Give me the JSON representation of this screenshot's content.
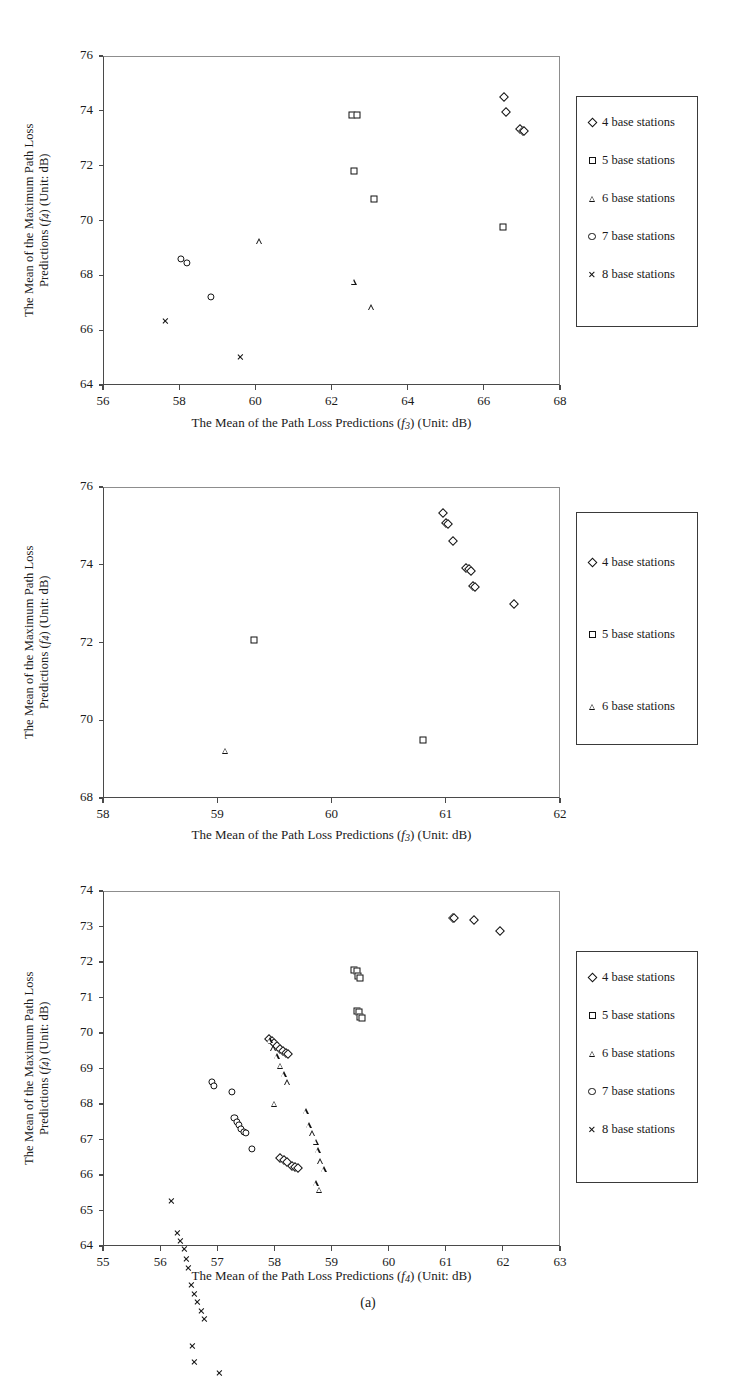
{
  "caption": "(a)",
  "bottom_bleed_text": "",
  "legend_labels": {
    "bs4": "4 base stations",
    "bs5": "5 base stations",
    "bs6": "6 base stations",
    "bs7": "7 base stations",
    "bs8": "8 base stations"
  },
  "chart_data": [
    {
      "id": "chart-top",
      "type": "scatter",
      "title": "",
      "xlabel": "The Mean of the Path Loss Predictions (f3) (Unit: dB)",
      "ylabel": "The Mean of the Maximum Path Loss Predictions (f4) (Unit: dB)",
      "xlim": [
        56,
        68
      ],
      "ylim": [
        64,
        76
      ],
      "xticks": [
        56,
        58,
        60,
        62,
        64,
        66,
        68
      ],
      "yticks": [
        64,
        66,
        68,
        70,
        72,
        74,
        76
      ],
      "grid": false,
      "legend_position": "right",
      "series": [
        {
          "name": "4 base stations",
          "marker": "diamond",
          "points": [
            [
              66.52,
              74.52
            ],
            [
              66.57,
              73.95
            ],
            [
              66.96,
              73.32
            ],
            [
              67.02,
              73.28
            ],
            [
              67.06,
              73.25
            ]
          ]
        },
        {
          "name": "5 base stations",
          "marker": "square",
          "points": [
            [
              62.55,
              73.86
            ],
            [
              62.68,
              73.86
            ],
            [
              62.6,
              71.8
            ],
            [
              63.12,
              70.78
            ],
            [
              66.5,
              69.75
            ]
          ]
        },
        {
          "name": "6 base stations",
          "marker": "triangle",
          "points": [
            [
              60.1,
              69.24
            ],
            [
              62.58,
              67.98
            ],
            [
              63.04,
              67.28
            ]
          ]
        },
        {
          "name": "7 base stations",
          "marker": "circle",
          "points": [
            [
              58.05,
              68.6
            ],
            [
              58.2,
              68.45
            ],
            [
              58.83,
              67.2
            ]
          ]
        },
        {
          "name": "8 base stations",
          "marker": "cross",
          "points": [
            [
              57.65,
              66.99
            ],
            [
              59.62,
              65.95
            ]
          ]
        }
      ]
    },
    {
      "id": "chart-middle",
      "type": "scatter",
      "title": "",
      "xlabel": "The Mean of the Path Loss Predictions (f3) (Unit: dB)",
      "ylabel": "The Mean of the Maximum Path Loss Predictions (f4) (Unit: dB)",
      "xlim": [
        58,
        62
      ],
      "ylim": [
        68,
        76
      ],
      "xticks": [
        58,
        59,
        60,
        61,
        62
      ],
      "yticks": [
        68,
        70,
        72,
        74,
        76
      ],
      "grid": false,
      "legend_position": "right",
      "series": [
        {
          "name": "4 base stations",
          "marker": "diamond",
          "points": [
            [
              60.98,
              75.32
            ],
            [
              61.0,
              75.08
            ],
            [
              61.02,
              75.04
            ],
            [
              61.06,
              74.6
            ],
            [
              61.18,
              73.92
            ],
            [
              61.2,
              73.88
            ],
            [
              61.22,
              73.85
            ],
            [
              61.24,
              73.45
            ],
            [
              61.26,
              73.42
            ],
            [
              61.6,
              72.98
            ]
          ]
        },
        {
          "name": "5 base stations",
          "marker": "square",
          "points": [
            [
              59.32,
              72.06
            ],
            [
              60.8,
              69.5
            ]
          ]
        },
        {
          "name": "6 base stations",
          "marker": "triangle",
          "points": [
            [
              59.07,
              69.22
            ]
          ]
        }
      ]
    },
    {
      "id": "chart-bottom",
      "type": "scatter",
      "title": "",
      "xlabel": "The Mean of the Path Loss Predictions (f4) (Unit: dB)",
      "ylabel": "The Mean of the Maximum Path Loss Predictions (f4) (Unit: dB)",
      "xlim": [
        55,
        63
      ],
      "ylim": [
        64,
        74
      ],
      "xticks": [
        55,
        56,
        57,
        58,
        59,
        60,
        61,
        62,
        63
      ],
      "yticks": [
        64,
        65,
        66,
        67,
        68,
        69,
        70,
        71,
        72,
        73,
        74
      ],
      "grid": false,
      "legend_position": "right",
      "series": [
        {
          "name": "4 base stations",
          "marker": "diamond",
          "points": [
            [
              61.12,
              73.25
            ],
            [
              61.15,
              73.24
            ],
            [
              61.5,
              73.19
            ],
            [
              61.95,
              72.87
            ],
            [
              57.9,
              69.82
            ],
            [
              57.95,
              69.77
            ],
            [
              58.0,
              69.72
            ],
            [
              58.05,
              69.62
            ],
            [
              58.1,
              69.56
            ],
            [
              58.15,
              69.5
            ],
            [
              58.2,
              69.45
            ],
            [
              58.24,
              69.4
            ],
            [
              58.1,
              66.48
            ],
            [
              58.16,
              66.42
            ],
            [
              58.22,
              66.38
            ],
            [
              58.3,
              66.25
            ],
            [
              58.36,
              66.22
            ],
            [
              58.42,
              66.2
            ]
          ]
        },
        {
          "name": "5 base stations",
          "marker": "square",
          "points": [
            [
              59.4,
              71.78
            ],
            [
              59.44,
              71.74
            ],
            [
              59.46,
              71.6
            ],
            [
              59.5,
              71.56
            ],
            [
              59.44,
              70.62
            ],
            [
              59.48,
              70.58
            ],
            [
              59.5,
              70.46
            ],
            [
              59.54,
              70.42
            ]
          ]
        },
        {
          "name": "6 base stations",
          "marker": "triangle",
          "points": [
            [
              57.92,
              69.8
            ],
            [
              57.98,
              69.74
            ],
            [
              58.04,
              69.68
            ],
            [
              58.1,
              69.58
            ],
            [
              58.16,
              69.52
            ],
            [
              58.22,
              69.46
            ],
            [
              58.0,
              69.02
            ],
            [
              58.55,
              68.98
            ],
            [
              58.6,
              68.75
            ],
            [
              58.66,
              68.7
            ],
            [
              58.72,
              68.62
            ],
            [
              58.76,
              68.56
            ],
            [
              58.8,
              68.42
            ],
            [
              58.86,
              68.36
            ],
            [
              58.72,
              68.14
            ],
            [
              58.78,
              68.12
            ]
          ]
        },
        {
          "name": "7 base stations",
          "marker": "circle",
          "points": [
            [
              56.9,
              68.62
            ],
            [
              56.94,
              68.5
            ],
            [
              57.25,
              68.34
            ],
            [
              57.3,
              67.6
            ],
            [
              57.34,
              67.5
            ],
            [
              57.38,
              67.4
            ],
            [
              57.42,
              67.3
            ],
            [
              57.46,
              67.22
            ],
            [
              57.5,
              67.18
            ],
            [
              57.6,
              66.74
            ]
          ]
        },
        {
          "name": "8 base stations",
          "marker": "cross",
          "points": [
            [
              56.2,
              67.96
            ],
            [
              56.3,
              67.28
            ],
            [
              56.36,
              67.24
            ],
            [
              56.42,
              67.2
            ],
            [
              56.46,
              67.14
            ],
            [
              56.5,
              67.06
            ],
            [
              56.55,
              66.78
            ],
            [
              56.6,
              66.74
            ],
            [
              56.66,
              66.7
            ],
            [
              56.72,
              66.66
            ],
            [
              56.78,
              66.62
            ],
            [
              56.56,
              66.06
            ],
            [
              56.6,
              65.8
            ],
            [
              57.04,
              65.68
            ],
            [
              57.28,
              65.08
            ],
            [
              57.48,
              65.06
            ],
            [
              57.56,
              64.78
            ]
          ]
        }
      ]
    }
  ]
}
